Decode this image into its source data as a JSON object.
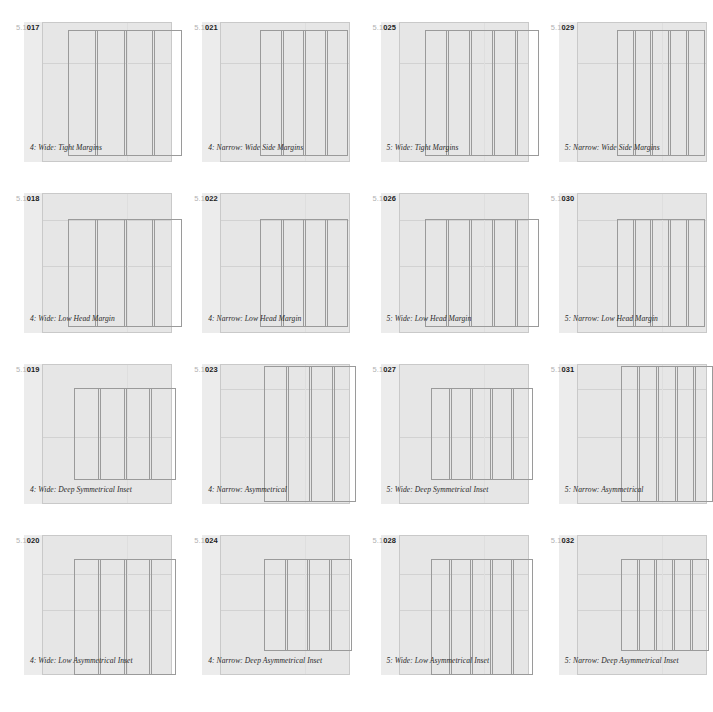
{
  "sheet": {
    "section": "5.1",
    "page_bg": "#ffffff",
    "field_color": "#ececec",
    "page_color": "#e6e6e6",
    "rule_color": "#9a9a9a",
    "guide_color": "#d2d2d2"
  },
  "panels": [
    {
      "section": "5.1",
      "number": "017",
      "caption": "4: Wide: Tight Margins",
      "columns": 4,
      "page": {
        "left": 18,
        "top": 0,
        "width": 130,
        "height": 140
      },
      "block": {
        "left": 26,
        "top": 8,
        "width": 114,
        "height": 126
      },
      "guides_h": [
        40
      ],
      "guides_v": [
        84
      ]
    },
    {
      "section": "5.1",
      "number": "021",
      "caption": "4: Narrow: Wide Side Margins",
      "columns": 4,
      "page": {
        "left": 18,
        "top": 0,
        "width": 130,
        "height": 140
      },
      "block": {
        "left": 40,
        "top": 8,
        "width": 88,
        "height": 126
      },
      "guides_h": [
        40
      ],
      "guides_v": [
        84
      ]
    },
    {
      "section": "5.1",
      "number": "025",
      "caption": "5: Wide: Tight Margins",
      "columns": 5,
      "page": {
        "left": 18,
        "top": 0,
        "width": 130,
        "height": 140
      },
      "block": {
        "left": 26,
        "top": 8,
        "width": 114,
        "height": 126
      },
      "guides_h": [
        40
      ],
      "guides_v": [
        84
      ]
    },
    {
      "section": "5.1",
      "number": "029",
      "caption": "5: Narrow: Wide Side Margins",
      "columns": 5,
      "page": {
        "left": 18,
        "top": 0,
        "width": 130,
        "height": 140
      },
      "block": {
        "left": 40,
        "top": 8,
        "width": 88,
        "height": 126
      },
      "guides_h": [
        40
      ],
      "guides_v": [
        84
      ]
    },
    {
      "section": "5.1",
      "number": "018",
      "caption": "4: Wide: Low Head Margin",
      "columns": 4,
      "page": {
        "left": 18,
        "top": 0,
        "width": 130,
        "height": 140
      },
      "block": {
        "left": 26,
        "top": 26,
        "width": 114,
        "height": 108
      },
      "guides_h": [
        26,
        72
      ],
      "guides_v": [
        84
      ]
    },
    {
      "section": "5.1",
      "number": "022",
      "caption": "4: Narrow: Low Head Margin",
      "columns": 4,
      "page": {
        "left": 18,
        "top": 0,
        "width": 130,
        "height": 140
      },
      "block": {
        "left": 40,
        "top": 26,
        "width": 88,
        "height": 108
      },
      "guides_h": [
        26,
        72
      ],
      "guides_v": [
        84
      ]
    },
    {
      "section": "5.1",
      "number": "026",
      "caption": "5: Wide: Low Head Margin",
      "columns": 5,
      "page": {
        "left": 18,
        "top": 0,
        "width": 130,
        "height": 140
      },
      "block": {
        "left": 26,
        "top": 26,
        "width": 114,
        "height": 108
      },
      "guides_h": [
        26,
        72
      ],
      "guides_v": [
        84
      ]
    },
    {
      "section": "5.1",
      "number": "030",
      "caption": "5: Narrow: Low Head Margin",
      "columns": 5,
      "page": {
        "left": 18,
        "top": 0,
        "width": 130,
        "height": 140
      },
      "block": {
        "left": 40,
        "top": 26,
        "width": 88,
        "height": 108
      },
      "guides_h": [
        26,
        72
      ],
      "guides_v": [
        84
      ]
    },
    {
      "section": "5.1",
      "number": "019",
      "caption": "4: Wide: Deep Symmetrical Inset",
      "columns": 4,
      "page": {
        "left": 18,
        "top": 0,
        "width": 130,
        "height": 140
      },
      "block": {
        "left": 32,
        "top": 24,
        "width": 102,
        "height": 92
      },
      "guides_h": [
        72
      ],
      "guides_v": [
        84
      ]
    },
    {
      "section": "5.1",
      "number": "023",
      "caption": "4: Narrow: Asymmetrical",
      "columns": 4,
      "page": {
        "left": 18,
        "top": 0,
        "width": 130,
        "height": 140
      },
      "block": {
        "left": 44,
        "top": 2,
        "width": 92,
        "height": 136
      },
      "guides_h": [
        24,
        72
      ],
      "guides_v": [
        84
      ]
    },
    {
      "section": "5.1",
      "number": "027",
      "caption": "5: Wide: Deep Symmetrical Inset",
      "columns": 5,
      "page": {
        "left": 18,
        "top": 0,
        "width": 130,
        "height": 140
      },
      "block": {
        "left": 32,
        "top": 24,
        "width": 102,
        "height": 92
      },
      "guides_h": [
        72
      ],
      "guides_v": [
        84
      ]
    },
    {
      "section": "5.1",
      "number": "031",
      "caption": "5: Narrow: Asymmetrical",
      "columns": 5,
      "page": {
        "left": 18,
        "top": 0,
        "width": 130,
        "height": 140
      },
      "block": {
        "left": 44,
        "top": 2,
        "width": 92,
        "height": 136
      },
      "guides_h": [
        24,
        72
      ],
      "guides_v": [
        84
      ]
    },
    {
      "section": "5.1",
      "number": "020",
      "caption": "4: Wide: Low Asymmetrical Inset",
      "columns": 4,
      "page": {
        "left": 18,
        "top": 0,
        "width": 130,
        "height": 140
      },
      "block": {
        "left": 32,
        "top": 24,
        "width": 102,
        "height": 116
      },
      "guides_h": [
        38,
        74
      ],
      "guides_v": [
        84
      ]
    },
    {
      "section": "5.1",
      "number": "024",
      "caption": "4: Narrow: Deep Asymmetrical Inset",
      "columns": 4,
      "page": {
        "left": 18,
        "top": 0,
        "width": 130,
        "height": 140
      },
      "block": {
        "left": 44,
        "top": 24,
        "width": 88,
        "height": 92
      },
      "guides_h": [
        38,
        74
      ],
      "guides_v": [
        84
      ]
    },
    {
      "section": "5.1",
      "number": "028",
      "caption": "5: Wide: Low Asymmetrical Inset",
      "columns": 5,
      "page": {
        "left": 18,
        "top": 0,
        "width": 130,
        "height": 140
      },
      "block": {
        "left": 32,
        "top": 24,
        "width": 102,
        "height": 116
      },
      "guides_h": [
        38,
        74
      ],
      "guides_v": [
        84
      ]
    },
    {
      "section": "5.1",
      "number": "032",
      "caption": "5: Narrow: Deep Asymmetrical Inset",
      "columns": 5,
      "page": {
        "left": 18,
        "top": 0,
        "width": 130,
        "height": 140
      },
      "block": {
        "left": 44,
        "top": 24,
        "width": 88,
        "height": 92
      },
      "guides_h": [
        38,
        74
      ],
      "guides_v": [
        84
      ]
    }
  ]
}
